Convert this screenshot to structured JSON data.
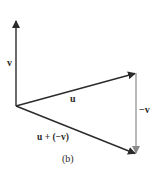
{
  "diagram": {
    "caption": "(b)",
    "colors": {
      "vector": "#2b2b2b",
      "neg_vector": "#8a8a8a"
    },
    "vectors": [
      {
        "name": "v",
        "label": "v",
        "from": [
          16,
          106
        ],
        "to": [
          16,
          20
        ]
      },
      {
        "name": "u",
        "label": "u",
        "from": [
          16,
          106
        ],
        "to": [
          136,
          73
        ]
      },
      {
        "name": "neg-v",
        "label": "−v",
        "from": [
          136,
          73
        ],
        "to": [
          136,
          154
        ]
      },
      {
        "name": "u-plus-neg-v",
        "label": "u + (−v)",
        "from": [
          16,
          106
        ],
        "to": [
          136,
          154
        ]
      }
    ],
    "labels": {
      "v": "v",
      "u": "u",
      "neg_v": "−v",
      "sum": "u + (−v)"
    }
  }
}
